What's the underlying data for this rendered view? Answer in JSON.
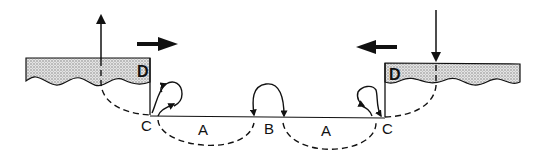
{
  "diagram": {
    "type": "cross-section schematic",
    "labels": {
      "left_block": "D",
      "right_block": "D",
      "left_corner": "C",
      "right_corner": "C",
      "left_arc": "A",
      "right_arc": "A",
      "center": "B"
    },
    "arrows": {
      "left_vertical": "up",
      "right_vertical": "down",
      "left_horizontal": "right",
      "right_horizontal": "left"
    },
    "colors": {
      "ink": "#111111",
      "stipple": "#bdbdbd",
      "background": "#ffffff"
    }
  }
}
